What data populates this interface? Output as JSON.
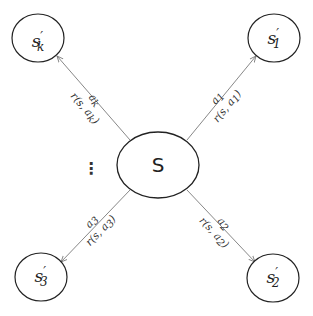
{
  "diagram": {
    "type": "state-transition",
    "center": {
      "label": "S"
    },
    "ellipsis": "⋮",
    "nodes": [
      {
        "id": "sk",
        "base": "s",
        "prime": "′",
        "sub": "k"
      },
      {
        "id": "s1",
        "base": "s",
        "prime": "′",
        "sub": "1"
      },
      {
        "id": "s2",
        "base": "s",
        "prime": "′",
        "sub": "2"
      },
      {
        "id": "s3",
        "base": "s",
        "prime": "′",
        "sub": "3"
      }
    ],
    "edges": [
      {
        "to": "sk",
        "action_base": "a",
        "action_sub": "k",
        "reward_prefix": "r(s, a",
        "reward_sub": "k",
        "reward_suffix": ")"
      },
      {
        "to": "s1",
        "action_base": "a",
        "action_sub": "1",
        "reward_prefix": "r(s, a",
        "reward_sub": "1",
        "reward_suffix": ")"
      },
      {
        "to": "s2",
        "action_base": "a",
        "action_sub": "2",
        "reward_prefix": "r(s, a",
        "reward_sub": "2",
        "reward_suffix": ")"
      },
      {
        "to": "s3",
        "action_base": "a",
        "action_sub": "3",
        "reward_prefix": "r(s, a",
        "reward_sub": "3",
        "reward_suffix": ")"
      }
    ]
  }
}
